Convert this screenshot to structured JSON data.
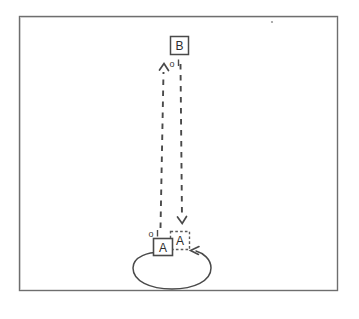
{
  "figure": {
    "kind": "state-transition-diagram",
    "background_color": "#ffffff",
    "stroke_color": "#4a4a4a",
    "frame": {
      "name": "outer-frame",
      "x": 19,
      "y": 16,
      "width": 318,
      "height": 274,
      "style": "solid",
      "stroke_color": "#6e6e6e"
    },
    "nodes": [
      {
        "id": "B",
        "label": "B",
        "style": "solid",
        "x": 170,
        "y": 45,
        "width": 18,
        "height": 18
      },
      {
        "id": "A",
        "label": "A",
        "style": "solid",
        "x": 162,
        "y": 247,
        "width": 19,
        "height": 17
      },
      {
        "id": "A-prime",
        "label": "A",
        "style": "dashed",
        "x": 180,
        "y": 240,
        "width": 19,
        "height": 18
      }
    ],
    "edges": [
      {
        "id": "a-to-b",
        "from": "A",
        "to": "B",
        "style": "dashed",
        "direction": "up",
        "arrowhead": "open-v"
      },
      {
        "id": "b-to-a",
        "from": "B",
        "to": "A-prime",
        "style": "dashed",
        "direction": "down",
        "arrowhead": "open-v"
      },
      {
        "id": "self-loop-a",
        "from": "A",
        "to": "A-prime",
        "style": "solid",
        "direction": "left",
        "shape": "ellipse-loop",
        "arrowhead": "open-v"
      }
    ],
    "markers": [
      {
        "id": "marker-top",
        "label": "o",
        "x": 177,
        "y": 64
      },
      {
        "id": "marker-bottom",
        "label": "o",
        "x": 152,
        "y": 231
      }
    ],
    "speck": {
      "id": "scan-speck",
      "x": 272,
      "y": 22
    }
  }
}
